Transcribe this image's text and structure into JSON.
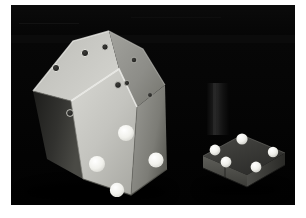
{
  "image": {
    "kind": "photograph",
    "subject": "machine-vision calibration objects on black background",
    "border_color": "#ffffff",
    "background_color": "#050505",
    "canvas": {
      "x": 11,
      "y": 5,
      "width": 284,
      "height": 200
    }
  },
  "objects": [
    {
      "id": "large-polyhedron",
      "label": "large polyhedral calibration block",
      "material_color": "#c9c9c4",
      "shaded_face_color": "#8f8f8c",
      "dark_face_color": "#2a2a28",
      "top_face_color": "#b9b9b4",
      "marker_counts": {
        "dark_holes": 8,
        "white_dots": 4
      }
    },
    {
      "id": "small-platform",
      "label": "small dark platform with sphere markers",
      "top_color": "#3a3a38",
      "side_color": "#4a4a46",
      "marker_color": "#f2f2ee",
      "marker_count": 5
    },
    {
      "id": "upright-object",
      "label": "faint dark vertical object",
      "color": "#222222"
    }
  ],
  "markers": {
    "dark_hole_fill": "#2b2b29",
    "dark_hole_rim": "#e3e3dd",
    "white_dot_fill": "#f4f4f0",
    "white_dot_rim": "#cfcfc9"
  },
  "polyhedron_holes": [
    {
      "cx": 60,
      "cy": 26,
      "r": 3.6
    },
    {
      "cx": 80,
      "cy": 20,
      "r": 3.2
    },
    {
      "cx": 31,
      "cy": 41,
      "r": 3.6
    },
    {
      "cx": 109,
      "cy": 33,
      "r": 2.8
    },
    {
      "cx": 93,
      "cy": 58,
      "r": 3.4
    },
    {
      "cx": 102,
      "cy": 56,
      "r": 2.6
    },
    {
      "cx": 125,
      "cy": 68,
      "r": 2.4
    },
    {
      "cx": 45,
      "cy": 86,
      "r": 3.4
    }
  ],
  "polyhedron_dots": [
    {
      "cx": 101,
      "cy": 106,
      "r": 8.0
    },
    {
      "cx": 131,
      "cy": 133,
      "r": 7.6
    },
    {
      "cx": 72,
      "cy": 137,
      "r": 8.0
    },
    {
      "cx": 92,
      "cy": 163,
      "r": 7.2
    }
  ],
  "platform_spheres": [
    {
      "cx": 45,
      "cy": 16,
      "r": 5.6
    },
    {
      "cx": 18,
      "cy": 27,
      "r": 5.4
    },
    {
      "cx": 76,
      "cy": 29,
      "r": 5.2
    },
    {
      "cx": 29,
      "cy": 39,
      "r": 5.4
    },
    {
      "cx": 59,
      "cy": 44,
      "r": 5.4
    }
  ]
}
